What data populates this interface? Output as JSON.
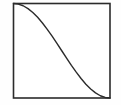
{
  "figure": {
    "name": "sigmoid-decay-plot",
    "background_color": "#fefefe",
    "plot_background_color": "#ffffff",
    "frame_color": "#2b2b2b",
    "curve_color": "#2b2b2b",
    "frame": {
      "x": 13.5,
      "y": 3.5,
      "width": 96.5,
      "height": 94.5
    }
  },
  "chart_data": {
    "type": "line",
    "title": "",
    "subtitle": "",
    "xlabel": "",
    "ylabel": "",
    "xlim": [
      0,
      1
    ],
    "ylim": [
      0,
      1
    ],
    "grid": false,
    "legend": null,
    "legend_position": "none",
    "xticks": [],
    "yticks": [],
    "xticklabels": [],
    "yticklabels": [],
    "annotations": [],
    "series": [
      {
        "name": "decreasing-sigmoid",
        "color": "#2b2b2b",
        "linewidth": 1.4,
        "style": "solid",
        "x": [
          0.0,
          0.05,
          0.1,
          0.15,
          0.2,
          0.25,
          0.3,
          0.35,
          0.4,
          0.45,
          0.5,
          0.55,
          0.6,
          0.65,
          0.7,
          0.75,
          0.8,
          0.85,
          0.9,
          0.95,
          1.0
        ],
        "y": [
          1.0,
          0.994,
          0.976,
          0.946,
          0.905,
          0.854,
          0.794,
          0.727,
          0.655,
          0.578,
          0.5,
          0.422,
          0.345,
          0.273,
          0.206,
          0.146,
          0.095,
          0.054,
          0.024,
          0.006,
          0.0
        ]
      }
    ]
  }
}
